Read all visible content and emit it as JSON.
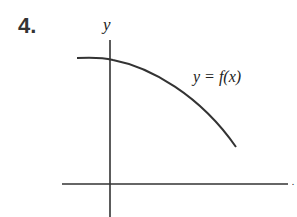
{
  "problem": {
    "number": "4."
  },
  "graph": {
    "y_axis_label": "y",
    "x_axis_label": "x",
    "curve_label": "y = f(x)",
    "curve_description": "decreasing concave-down curve crossing the y-axis above the x-axis"
  }
}
